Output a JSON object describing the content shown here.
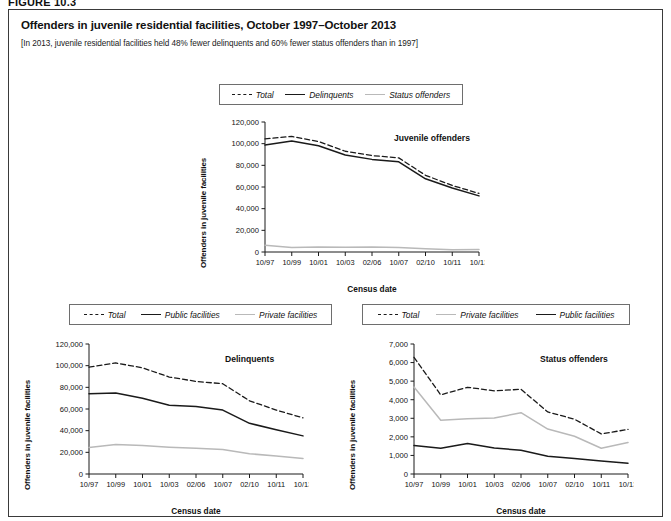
{
  "figure": {
    "label": "FIGURE 10.3",
    "title": "Offenders in juvenile residential facilities, October 1997–October 2013",
    "subtitle": "[In 2013, juvenile residential facilities held 48% fewer delinquents and 60% fewer status offenders than in 1997]"
  },
  "chart_data": [
    {
      "type": "line",
      "id": "juvenile-offenders",
      "title": "Juvenile offenders",
      "xlabel": "Census date",
      "ylabel": "Offenders in juvenile facilities",
      "categories": [
        "10/97",
        "10/99",
        "10/01",
        "10/03",
        "02/06",
        "10/07",
        "02/10",
        "10/11",
        "10/13"
      ],
      "ylim": [
        0,
        120000
      ],
      "yticks": [
        0,
        20000,
        40000,
        60000,
        80000,
        100000,
        120000
      ],
      "ytick_labels": [
        "0",
        "20,000",
        "40,000",
        "60,000",
        "80,000",
        "100,000",
        "120,000"
      ],
      "grid": false,
      "legend_position": "top",
      "series": [
        {
          "name": "Total",
          "style": "dashed",
          "color": "#1a1a1a",
          "values": [
            104400,
            106700,
            102000,
            93000,
            89000,
            86900,
            70800,
            61400,
            54100
          ]
        },
        {
          "name": "Delinquents",
          "style": "solid",
          "color": "#1a1a1a",
          "values": [
            98700,
            102500,
            98000,
            89500,
            85500,
            83300,
            67600,
            59000,
            51800
          ]
        },
        {
          "name": "Status offenders",
          "style": "light",
          "color": "#b9b9b9",
          "values": [
            6300,
            4200,
            4700,
            4500,
            4600,
            4100,
            2900,
            2100,
            2400
          ]
        }
      ]
    },
    {
      "type": "line",
      "id": "delinquents",
      "title": "Delinquents",
      "xlabel": "Census date",
      "ylabel": "Offenders in juvenile facilities",
      "categories": [
        "10/97",
        "10/99",
        "10/01",
        "10/03",
        "02/06",
        "10/07",
        "02/10",
        "10/11",
        "10/13"
      ],
      "ylim": [
        0,
        120000
      ],
      "yticks": [
        0,
        20000,
        40000,
        60000,
        80000,
        100000,
        120000
      ],
      "ytick_labels": [
        "0",
        "20,000",
        "40,000",
        "60,000",
        "80,000",
        "100,000",
        "120,000"
      ],
      "grid": false,
      "legend_position": "top",
      "series": [
        {
          "name": "Total",
          "style": "dashed",
          "color": "#1a1a1a",
          "values": [
            98700,
            102500,
            98000,
            89500,
            85500,
            83300,
            67600,
            59000,
            51800
          ]
        },
        {
          "name": "Public facilities",
          "style": "solid",
          "color": "#1a1a1a",
          "values": [
            74000,
            74800,
            70000,
            63500,
            62300,
            59000,
            46800,
            40800,
            35200
          ]
        },
        {
          "name": "Private facilities",
          "style": "light",
          "color": "#b9b9b9",
          "values": [
            24500,
            27200,
            26200,
            24800,
            23700,
            22700,
            18700,
            16600,
            14400
          ]
        }
      ]
    },
    {
      "type": "line",
      "id": "status-offenders",
      "title": "Status offenders",
      "xlabel": "Census date",
      "ylabel": "Offenders in juvenile facilities",
      "categories": [
        "10/97",
        "10/99",
        "10/01",
        "10/03",
        "02/06",
        "10/07",
        "02/10",
        "10/11",
        "10/13"
      ],
      "ylim": [
        0,
        7000
      ],
      "yticks": [
        0,
        1000,
        2000,
        3000,
        4000,
        5000,
        6000,
        7000
      ],
      "ytick_labels": [
        "0",
        "1,000",
        "2,000",
        "3,000",
        "4,000",
        "5,000",
        "6,000",
        "7,000"
      ],
      "grid": false,
      "legend_position": "top",
      "series": [
        {
          "name": "Total",
          "style": "dashed",
          "color": "#1a1a1a",
          "values": [
            6280,
            4260,
            4670,
            4480,
            4560,
            3340,
            2950,
            2160,
            2400
          ]
        },
        {
          "name": "Private facilities",
          "style": "light",
          "color": "#b9b9b9",
          "values": [
            4680,
            2890,
            2970,
            3010,
            3300,
            2420,
            2030,
            1390,
            1700
          ]
        },
        {
          "name": "Public facilities",
          "style": "solid",
          "color": "#1a1a1a",
          "values": [
            1540,
            1390,
            1640,
            1400,
            1280,
            960,
            840,
            700,
            580
          ]
        }
      ]
    }
  ]
}
